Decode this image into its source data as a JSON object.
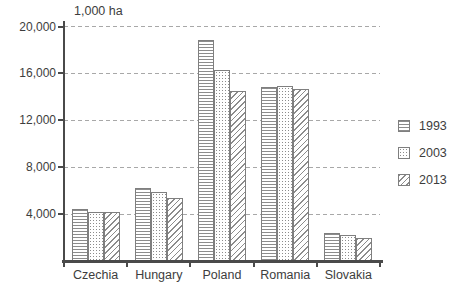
{
  "chart_data": {
    "type": "bar",
    "title": "1,000 ha",
    "ylabel": "1,000 ha",
    "xlabel": "",
    "categories": [
      "Czechia",
      "Hungary",
      "Poland",
      "Romania",
      "Slovakia"
    ],
    "series": [
      {
        "name": "1993",
        "pattern": "horizontal-lines",
        "values": [
          4400,
          6200,
          18850,
          14800,
          2400
        ]
      },
      {
        "name": "2003",
        "pattern": "dots",
        "values": [
          4150,
          5850,
          16250,
          14900,
          2200
        ]
      },
      {
        "name": "2013",
        "pattern": "diagonal-lines",
        "values": [
          4150,
          5350,
          14500,
          14650,
          1950
        ]
      }
    ],
    "y_axis": {
      "min": 0,
      "max": 20000,
      "tick_step": 4000,
      "ticks": [
        {
          "value": 4000,
          "label": "4,000"
        },
        {
          "value": 8000,
          "label": "8,000"
        },
        {
          "value": 12000,
          "label": "12,000"
        },
        {
          "value": 16000,
          "label": "16,000"
        },
        {
          "value": 20000,
          "label": "20,000"
        }
      ]
    },
    "legend": {
      "position": "right",
      "entries": [
        "1993",
        "2003",
        "2013"
      ]
    },
    "grid": "horizontal-dashed",
    "colors": {
      "background": "#ffffff",
      "pattern_ink": "#8c8c8c",
      "bar_outline": "#7f7f7f",
      "axis": "#4a4a4a",
      "gridline": "#a8a8a8",
      "text": "#3d3d3d"
    }
  }
}
